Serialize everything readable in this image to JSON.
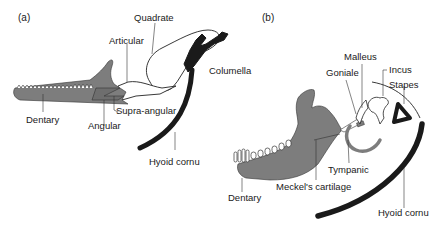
{
  "figure": {
    "colors": {
      "bone_fill": "#7d7d7d",
      "cartilage_black": "#1a1a1a",
      "outline": "#222222",
      "background": "#ffffff"
    },
    "panel_a": {
      "label": "(a)",
      "labels": {
        "quadrate": "Quadrate",
        "articular": "Articular",
        "columella": "Columella",
        "supra_angular": "Supra-angular",
        "dentary": "Dentary",
        "angular": "Angular",
        "hyoid_cornu": "Hyoid cornu"
      }
    },
    "panel_b": {
      "label": "(b)",
      "labels": {
        "malleus": "Malleus",
        "goniale": "Goniale",
        "incus": "Incus",
        "stapes": "Stapes",
        "tympanic": "Tympanic",
        "meckels_cartilage": "Meckel's cartilage",
        "dentary": "Dentary",
        "hyoid_cornu": "Hyoid cornu"
      }
    }
  }
}
